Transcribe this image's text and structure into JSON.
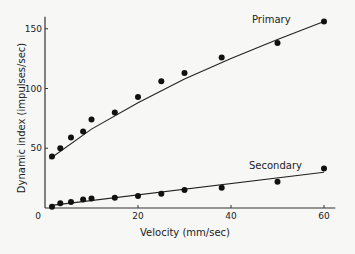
{
  "chart_data": {
    "type": "scatter",
    "title": "",
    "xlabel": "Velocity (mm/sec)",
    "ylabel": "Dynamic index (impulses/sec)",
    "xlim": [
      0,
      62
    ],
    "ylim": [
      0,
      160
    ],
    "x_ticks": [
      0,
      20,
      40,
      60
    ],
    "y_ticks": [
      0,
      50,
      100,
      150
    ],
    "grid": false,
    "legend": "inline labels",
    "series": [
      {
        "name": "Primary",
        "x": [
          1.5,
          3.3,
          5.6,
          8.2,
          10,
          15,
          20,
          25,
          30,
          38,
          50,
          60
        ],
        "values": [
          43,
          50,
          59,
          64,
          74,
          80,
          93,
          106,
          113,
          126,
          138,
          156
        ],
        "fit_line": {
          "x": [
            1,
            10,
            20,
            30,
            40,
            50,
            60
          ],
          "values": [
            41,
            66,
            88,
            108,
            125,
            141,
            156
          ]
        }
      },
      {
        "name": "Secondary",
        "x": [
          1.5,
          3.3,
          5.6,
          8.2,
          10,
          15,
          20,
          25,
          30,
          38,
          50,
          60
        ],
        "values": [
          1,
          4,
          5,
          7,
          8,
          8.5,
          10,
          12,
          15,
          17,
          22,
          33
        ],
        "fit_line": {
          "x": [
            1,
            60
          ],
          "values": [
            2,
            30
          ]
        }
      }
    ]
  }
}
